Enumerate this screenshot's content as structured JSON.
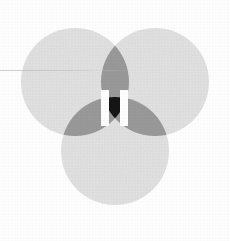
{
  "image": {
    "kind": "venn-diagram-logo",
    "title": "Three-circle Venn diagram with pause glyph",
    "width": 230,
    "height": 241,
    "background_color": "#ffffff"
  },
  "palette": {
    "circle_fill": "#e3e3e3",
    "pair_overlap": "#9b9b9b",
    "triple_overlap": "#141414",
    "glyph_color": "#ffffff",
    "scan_line": "#aaaaaa"
  },
  "diagram": {
    "circle_count": 3,
    "radius": 54,
    "circles": [
      {
        "name": "top-left-circle",
        "label": "A",
        "cx": 75,
        "cy": 82,
        "r": 54,
        "fill": "#e3e3e3"
      },
      {
        "name": "top-right-circle",
        "label": "B",
        "cx": 155,
        "cy": 82,
        "r": 54,
        "fill": "#e3e3e3"
      },
      {
        "name": "bottom-circle",
        "label": "C",
        "cx": 115,
        "cy": 151,
        "r": 54,
        "fill": "#e3e3e3"
      }
    ],
    "pair_regions": [
      {
        "name": "overlap-ab",
        "label": "A ∩ B",
        "fill": "#9b9b9b"
      },
      {
        "name": "overlap-ac",
        "label": "A ∩ C",
        "fill": "#9b9b9b"
      },
      {
        "name": "overlap-bc",
        "label": "B ∩ C",
        "fill": "#9b9b9b"
      }
    ],
    "triple_region": {
      "name": "overlap-abc",
      "label": "A ∩ B ∩ C",
      "fill": "#141414"
    }
  },
  "glyph": {
    "name": "pause-glyph",
    "text": "II",
    "bar_count": 2,
    "color": "#ffffff",
    "bars": [
      {
        "name": "pause-bar-left",
        "x": 101,
        "y": 90,
        "width": 8,
        "height": 36
      },
      {
        "name": "pause-bar-right",
        "x": 120,
        "y": 90,
        "width": 8,
        "height": 36
      }
    ]
  },
  "artifacts": {
    "scan_line": {
      "name": "scan-line-artifact",
      "visible": true,
      "y": 70,
      "length": 132
    }
  }
}
